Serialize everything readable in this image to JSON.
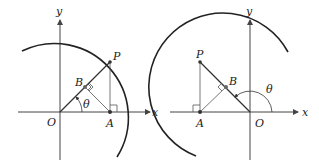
{
  "figures": [
    {
      "id": "left",
      "labels": {
        "y_axis": "y",
        "x_axis": "x",
        "origin": "O",
        "point_p": "P",
        "point_a": "A",
        "point_b": "B",
        "angle": "θ"
      }
    },
    {
      "id": "right",
      "labels": {
        "y_axis": "y",
        "x_axis": "x",
        "origin": "O",
        "point_p": "P",
        "point_a": "A",
        "point_b": "B",
        "angle": "θ"
      }
    }
  ],
  "colors": {
    "line": "#333333",
    "axis": "#444444",
    "arc": "#222222",
    "background": "#ffffff"
  }
}
